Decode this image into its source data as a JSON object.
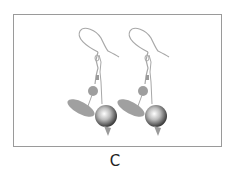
{
  "figure": {
    "panel_label": "C",
    "copies": [
      {
        "name": "left-view",
        "offset_x": 0
      },
      {
        "name": "right-view",
        "offset_x": 50
      }
    ],
    "colors": {
      "frame": "#9a9a9a",
      "structure": "#a8a8a8",
      "sphere_light": "#ffffff",
      "sphere_dark": "#3a3a3a"
    }
  }
}
